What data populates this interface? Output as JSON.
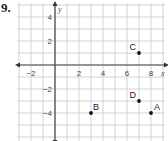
{
  "problem_number": "9.",
  "chart_data": {
    "type": "scatter",
    "title": "",
    "xlabel": "x",
    "ylabel": "y",
    "xlim": [
      -3,
      9
    ],
    "ylim": [
      -6,
      5
    ],
    "grid": true,
    "x_ticks": [
      -2,
      2,
      4,
      6,
      8
    ],
    "y_ticks": [
      4,
      2,
      -2,
      -4
    ],
    "x_tick_labels": [
      "−2",
      "2",
      "4",
      "6",
      "8"
    ],
    "y_tick_labels": [
      "4",
      "2",
      "−2",
      "−4"
    ],
    "points": [
      {
        "label": "A",
        "x": 8,
        "y": -4
      },
      {
        "label": "B",
        "x": 3,
        "y": -4
      },
      {
        "label": "C",
        "x": 7,
        "y": 1
      },
      {
        "label": "D",
        "x": 7,
        "y": -3
      }
    ]
  }
}
